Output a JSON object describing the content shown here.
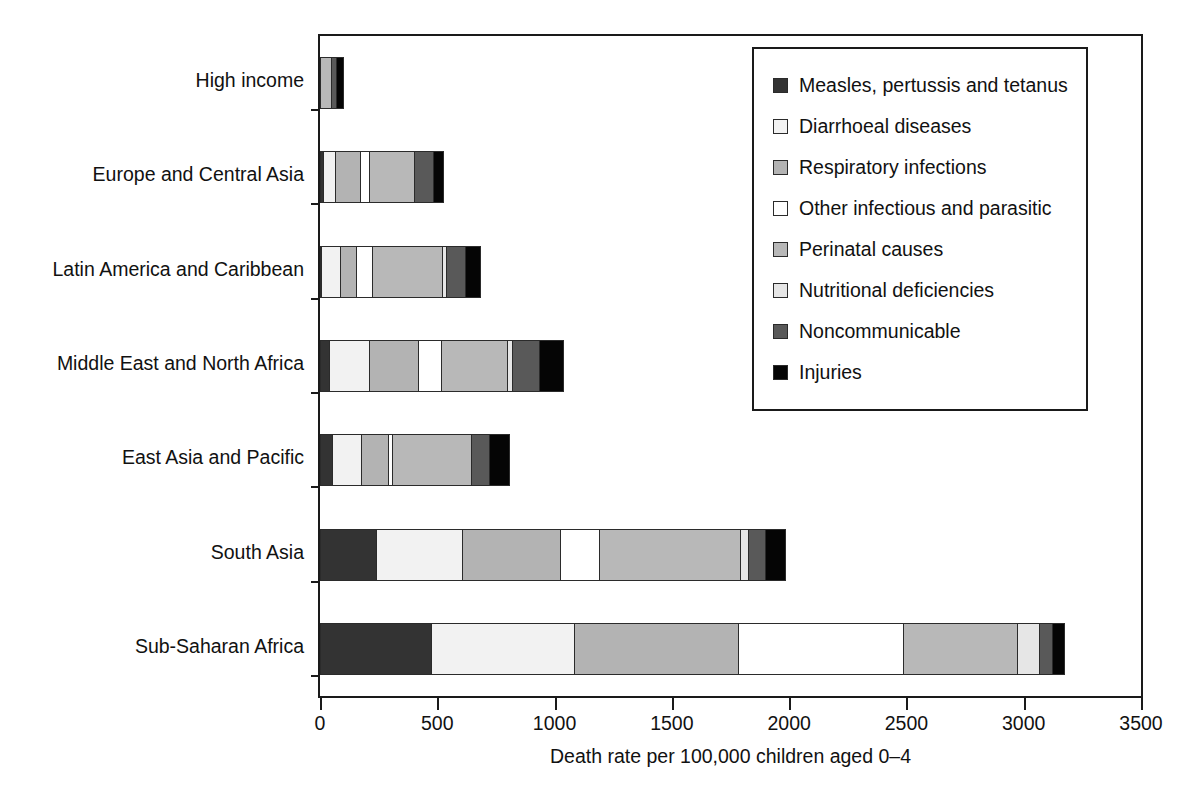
{
  "chart_data": {
    "type": "bar",
    "orientation": "horizontal",
    "stacked": true,
    "title": "",
    "xlabel": "Death rate per 100,000 children aged 0–4",
    "ylabel": "",
    "xlim": [
      0,
      3500
    ],
    "xticks": [
      0,
      500,
      1000,
      1500,
      2000,
      2500,
      3000,
      3500
    ],
    "xtick_labels": [
      "0",
      "500",
      "1000",
      "1500",
      "2000",
      "2500",
      "3000",
      "3500"
    ],
    "grid": false,
    "legend_position": "top-right",
    "categories": [
      "High income",
      "Europe and Central Asia",
      "Latin America and Caribbean",
      "Middle East and North Africa",
      "East Asia and Pacific",
      "South Asia",
      "Sub-Saharan Africa"
    ],
    "series": [
      {
        "name": "Measles, pertussis and tetanus",
        "color": "#333333",
        "values": [
          0,
          17,
          9,
          43,
          55,
          243,
          477
        ]
      },
      {
        "name": "Diarrhoeal diseases",
        "color": "#f2f2f2",
        "values": [
          0,
          60,
          89,
          178,
          132,
          374,
          617
        ]
      },
      {
        "name": "Respiratory infections",
        "color": "#b3b3b3",
        "values": [
          0,
          110,
          72,
          213,
          119,
          422,
          703
        ]
      },
      {
        "name": "Other infectious and parasitic",
        "color": "#ffffff",
        "values": [
          0,
          43,
          73,
          106,
          22,
          174,
          711
        ]
      },
      {
        "name": "Perinatal causes",
        "color": "#b8b8b8",
        "values": [
          51,
          200,
          306,
          286,
          344,
          605,
          490
        ]
      },
      {
        "name": "Nutritional deficiencies",
        "color": "#e6e6e6",
        "values": [
          0,
          0,
          21,
          26,
          0,
          38,
          102
        ]
      },
      {
        "name": "Noncommunicable",
        "color": "#595959",
        "values": [
          30,
          85,
          85,
          119,
          81,
          81,
          60
        ]
      },
      {
        "name": "Injuries",
        "color": "#050505",
        "values": [
          34,
          47,
          69,
          107,
          90,
          90,
          54
        ]
      }
    ]
  },
  "legend": {
    "items": [
      {
        "label": "Measles, pertussis and tetanus",
        "color": "#333333"
      },
      {
        "label": "Diarrhoeal diseases",
        "color": "#f2f2f2"
      },
      {
        "label": "Respiratory infections",
        "color": "#b3b3b3"
      },
      {
        "label": "Other infectious and parasitic",
        "color": "#ffffff"
      },
      {
        "label": "Perinatal causes",
        "color": "#b8b8b8"
      },
      {
        "label": "Nutritional deficiencies",
        "color": "#e6e6e6"
      },
      {
        "label": "Noncommunicable",
        "color": "#595959"
      },
      {
        "label": "Injuries",
        "color": "#050505"
      }
    ]
  }
}
